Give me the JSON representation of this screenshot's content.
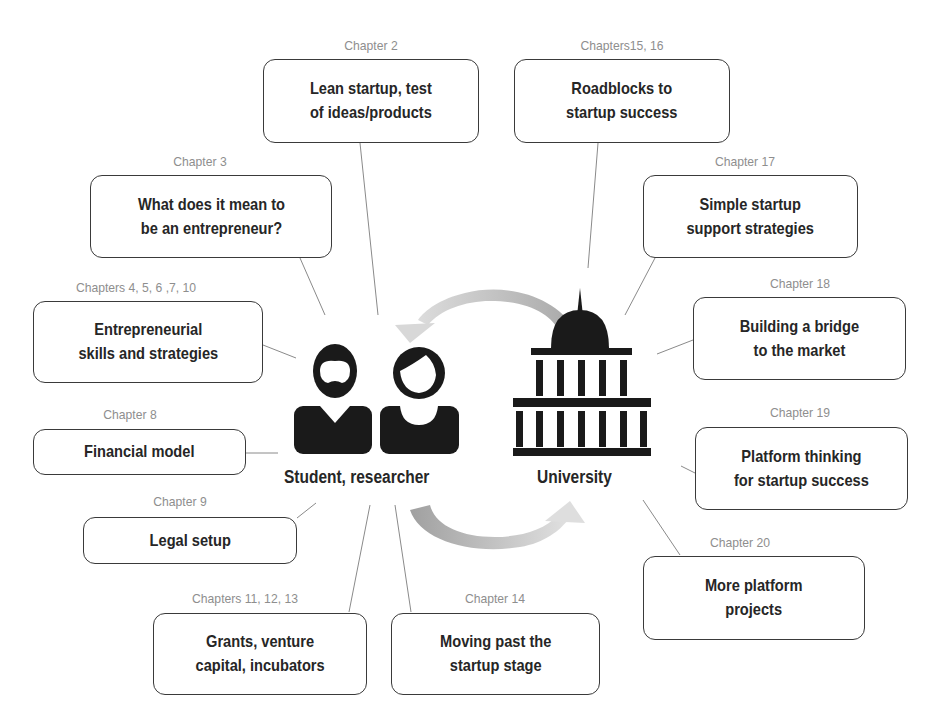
{
  "top_cropped_text": "...sp... by ...p...",
  "center": {
    "left_label": "Student, researcher",
    "right_label": "University",
    "left_icon": "people-icon",
    "right_icon": "university-building-icon",
    "cycle_arrows": "circular-arrows-icon"
  },
  "nodes": [
    {
      "id": "ch2",
      "chapter": "Chapter 2",
      "text": "Lean startup, test\nof ideas/products"
    },
    {
      "id": "ch15",
      "chapter": "Chapters15, 16",
      "text": "Roadblocks to\nstartup success"
    },
    {
      "id": "ch3",
      "chapter": "Chapter 3",
      "text": "What does it mean to\nbe an entrepreneur?"
    },
    {
      "id": "ch17",
      "chapter": "Chapter 17",
      "text": "Simple startup\nsupport strategies"
    },
    {
      "id": "ch4",
      "chapter": "Chapters 4, 5, 6 ,7, 10",
      "text": "Entrepreneurial\nskills and strategies"
    },
    {
      "id": "ch18",
      "chapter": "Chapter 18",
      "text": "Building a bridge\nto the market"
    },
    {
      "id": "ch8",
      "chapter": "Chapter 8",
      "text": "Financial model"
    },
    {
      "id": "ch19",
      "chapter": "Chapter 19",
      "text": "Platform thinking\nfor startup success"
    },
    {
      "id": "ch9",
      "chapter": "Chapter 9",
      "text": "Legal setup"
    },
    {
      "id": "ch20",
      "chapter": "Chapter 20",
      "text": "More platform\nprojects"
    },
    {
      "id": "ch11",
      "chapter": "Chapters 11, 12, 13",
      "text": "Grants, venture\ncapital, incubators"
    },
    {
      "id": "ch14",
      "chapter": "Chapter 14",
      "text": "Moving past the\nstartup stage"
    }
  ],
  "colors": {
    "box_border": "#3a3a3a",
    "chapter_text": "#8e8e8e",
    "icon_fill": "#1a1a1a",
    "arrow": "#b8b8b8",
    "connector": "#8a8a8a"
  }
}
